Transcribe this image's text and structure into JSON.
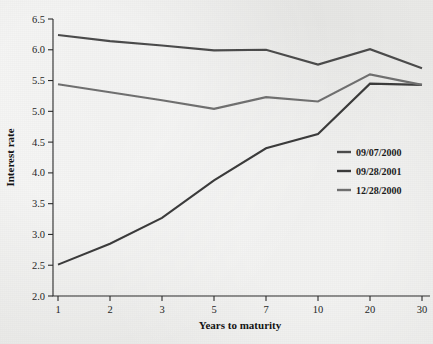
{
  "chart_data": {
    "type": "line",
    "title": "",
    "xlabel": "Years to maturity",
    "ylabel": "Interest rate",
    "categories": [
      "1",
      "2",
      "3",
      "5",
      "7",
      "10",
      "20",
      "30"
    ],
    "x_tick_labels": [
      "1",
      "2",
      "3",
      "5",
      "7",
      "10",
      "20",
      "30"
    ],
    "y_tick_labels": [
      "2.0",
      "2.5",
      "3.0",
      "3.5",
      "4.0",
      "4.5",
      "5.0",
      "5.5",
      "6.0",
      "6.5"
    ],
    "ylim": [
      2.0,
      6.5
    ],
    "y_tick_step": 0.5,
    "grid": false,
    "legend_position": "right-middle",
    "series": [
      {
        "name": "09/07/2000",
        "color": "#4a4a4a",
        "values": [
          6.24,
          6.14,
          6.07,
          5.99,
          6.0,
          5.76,
          6.01,
          5.7
        ]
      },
      {
        "name": "09/28/2001",
        "color": "#3a3a3a",
        "values": [
          2.51,
          2.85,
          3.27,
          3.88,
          4.4,
          4.63,
          5.45,
          5.43
        ]
      },
      {
        "name": "12/28/2000",
        "color": "#6f6f6f",
        "values": [
          5.44,
          5.31,
          5.18,
          5.04,
          5.23,
          5.16,
          5.6,
          5.43
        ]
      }
    ]
  },
  "legend": {
    "items": [
      {
        "label": "09/07/2000",
        "color": "#4a4a4a"
      },
      {
        "label": "09/28/2001",
        "color": "#3a3a3a"
      },
      {
        "label": "12/28/2000",
        "color": "#6f6f6f"
      }
    ]
  },
  "axes": {
    "x_title": "Years to maturity",
    "y_title": "Interest rate"
  }
}
